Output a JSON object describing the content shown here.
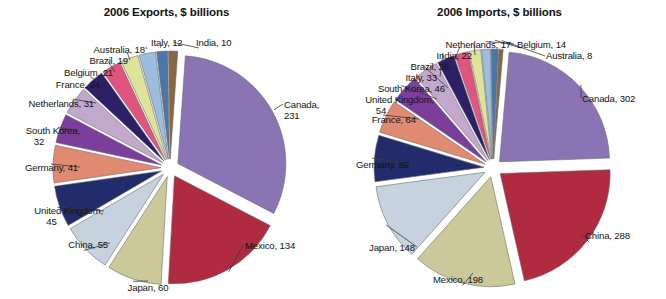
{
  "figure": {
    "background": "#ffffff",
    "text_color": "#141414",
    "leader_color": "#3a3a3a"
  },
  "panels": [
    {
      "id": "exports",
      "title": "2006 Exports, $ billions"
    },
    {
      "id": "imports",
      "title": "2006 Imports, $ billions"
    }
  ],
  "chart_data": [
    {
      "type": "pie",
      "title": "2006 Exports, $ billions",
      "xlabel": "",
      "ylabel": "",
      "unit": "$ billions",
      "year": 2006,
      "exploded": true,
      "legend": "none (direct labels with leader lines)",
      "categories": [
        "Canada",
        "Mexico",
        "Japan",
        "China",
        "United Kingdom",
        "Germany",
        "South Korea",
        "Netherlands",
        "France",
        "Belgium",
        "Brazil",
        "Australia",
        "Italy",
        "India"
      ],
      "values": [
        231,
        134,
        60,
        55,
        45,
        41,
        32,
        31,
        24,
        21,
        19,
        18,
        12,
        10
      ],
      "labels": [
        "Canada, 231",
        "Mexico, 134",
        "Japan, 60",
        "China, 55",
        "United Kingdom, 45",
        "Germany, 41",
        "South Korea, 32",
        "Netherlands, 31",
        "France, 24",
        "Belgium, 21",
        "Brazil, 19",
        "Australia, 18",
        "Italy, 12",
        "India, 10"
      ],
      "colors": [
        "#8B74B4",
        "#B02A40",
        "#CBC99A",
        "#C6D3DE",
        "#232C6B",
        "#E08A72",
        "#7B3F9B",
        "#C3A8CE",
        "#2E2066",
        "#E0557E",
        "#DDE49A",
        "#9CBCE0",
        "#4A77A8",
        "#8A6642"
      ]
    },
    {
      "type": "pie",
      "title": "2006 Imports, $ billions",
      "xlabel": "",
      "ylabel": "",
      "unit": "$ billions",
      "year": 2006,
      "exploded": true,
      "legend": "none (direct labels with leader lines)",
      "categories": [
        "Canada",
        "China",
        "Mexico",
        "Japan",
        "Germany",
        "France",
        "United Kingdom",
        "South Korea",
        "Italy",
        "Brazil",
        "India",
        "Netherlands",
        "Belgium",
        "Australia"
      ],
      "values": [
        302,
        288,
        198,
        148,
        89,
        64,
        54,
        46,
        33,
        26,
        22,
        17,
        14,
        8
      ],
      "labels": [
        "Canada, 302",
        "China, 288",
        "Mexico, 198",
        "Japan, 148",
        "Germany, 89",
        "France, 64",
        "United Kingdom, 54",
        "South Korea, 46",
        "Italy, 33",
        "Brazil, 26",
        "India, 22",
        "Netherlands, 17",
        "Belgium, 14",
        "Australia, 8"
      ],
      "colors": [
        "#8B74B4",
        "#B02A40",
        "#CBC99A",
        "#C6D3DE",
        "#232C6B",
        "#E08A72",
        "#7B3F9B",
        "#C3A8CE",
        "#2E2066",
        "#E0557E",
        "#DDE49A",
        "#9CBCE0",
        "#4A77A8",
        "#8A6642"
      ]
    }
  ],
  "exports_labels": {
    "canada": "Canada,",
    "canada_value": "231",
    "mexico": "Mexico, 134",
    "japan": "Japan, 60",
    "china": "China, 55",
    "uk": "United Kingdom,",
    "uk_value": "45",
    "germany": "Germany, 41",
    "south_korea": "South Korea,",
    "south_korea_value": "32",
    "netherlands": "Netherlands, 31",
    "france": "France, 24",
    "belgium": "Belgium, 21",
    "brazil": "Brazil, 19",
    "australia": "Australia, 18",
    "italy": "Italy, 12",
    "india": "India, 10"
  },
  "imports_labels": {
    "canada": "Canada, 302",
    "china": "China, 288",
    "mexico": "Mexico, 198",
    "japan": "Japan, 148",
    "germany": "Germany, 89",
    "france": "France, 64",
    "uk": "United Kingdom,",
    "uk_value": "54",
    "south_korea": "South Korea, 46",
    "italy": "Italy, 33",
    "brazil": "Brazil, 26",
    "india": "India, 22",
    "netherlands": "Netherlands, 17",
    "belgium": "Belgium, 14",
    "australia": "Australia, 8"
  }
}
